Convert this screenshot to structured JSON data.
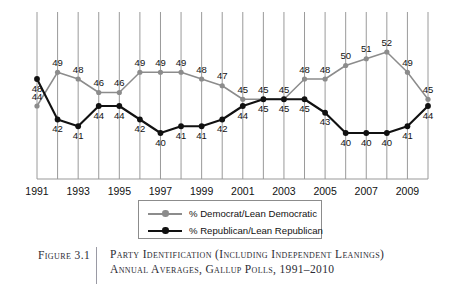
{
  "figure": {
    "label": "Figure 3.1",
    "caption": "Party Identification (Including Independent Leanings) Annual Averages, Gallup Polls, 1991–2010"
  },
  "legend": {
    "position": "below-plot",
    "items": [
      {
        "label": "% Democrat/Lean Democratic",
        "color": "#8c8c8c",
        "marker": "circle"
      },
      {
        "label": "% Republican/Lean Republican",
        "color": "#111111",
        "marker": "circle"
      }
    ]
  },
  "chart_data": {
    "type": "line",
    "title": "Party Identification (Including Independent Leanings) Annual Averages, Gallup Polls, 1991–2010",
    "xlabel": "",
    "ylabel": "",
    "grid": "vertical-only",
    "legend_position": "bottom",
    "ylim": [
      38,
      54
    ],
    "x": [
      1991,
      1992,
      1993,
      1994,
      1995,
      1996,
      1997,
      1998,
      1999,
      2000,
      2001,
      2002,
      2003,
      2004,
      2005,
      2006,
      2007,
      2008,
      2009,
      2010
    ],
    "tick_labels": [
      "1991",
      "",
      "1993",
      "",
      "1995",
      "",
      "1997",
      "",
      "1999",
      "",
      "2001",
      "",
      "2003",
      "",
      "2005",
      "",
      "2007",
      "",
      "2009",
      ""
    ],
    "series": [
      {
        "name": "% Democrat/Lean Democratic",
        "color": "#8c8c8c",
        "values": [
          44,
          49,
          48,
          46,
          46,
          49,
          49,
          49,
          48,
          47,
          45,
          45,
          45,
          48,
          48,
          50,
          51,
          52,
          49,
          45
        ]
      },
      {
        "name": "% Republican/Lean Republican",
        "color": "#111111",
        "values": [
          48,
          42,
          41,
          44,
          44,
          42,
          40,
          41,
          41,
          42,
          44,
          45,
          45,
          45,
          43,
          40,
          40,
          40,
          41,
          44
        ]
      }
    ]
  }
}
